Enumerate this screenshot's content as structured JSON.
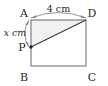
{
  "figure": {
    "type": "geometry-diagram",
    "shape": "rectangle-with-inscribed-triangle",
    "background_color": "#ffffff",
    "stroke_color": "#6e6e6e",
    "diagonal_color": "#3a3a3a",
    "shade_color": "#f2f2f2",
    "text_color": "#2b2b2b",
    "vertices": {
      "A": {
        "label": "A",
        "x": 31,
        "y": 20,
        "position": "top-left"
      },
      "D": {
        "label": "D",
        "x": 86,
        "y": 20,
        "position": "top-right"
      },
      "C": {
        "label": "C",
        "x": 86,
        "y": 66,
        "position": "bottom-right"
      },
      "B": {
        "label": "B",
        "x": 31,
        "y": 66,
        "position": "bottom-left"
      },
      "P": {
        "label": "P",
        "x": 31,
        "y": 47,
        "position": "left-side-point",
        "marked": true
      }
    },
    "segments": [
      {
        "name": "side-AD",
        "from": "A",
        "to": "D"
      },
      {
        "name": "side-DC",
        "from": "D",
        "to": "C"
      },
      {
        "name": "side-CB",
        "from": "C",
        "to": "B"
      },
      {
        "name": "side-BA",
        "from": "B",
        "to": "A"
      },
      {
        "name": "diagonal-PD",
        "from": "P",
        "to": "D"
      }
    ],
    "shaded_region": {
      "name": "triangle-APD",
      "vertices": [
        "A",
        "P",
        "D"
      ]
    },
    "dimensions": [
      {
        "name": "top-dimension-AD",
        "label": "4 cm",
        "value": "4",
        "unit": "cm",
        "italic": false,
        "spans": [
          "A",
          "D"
        ],
        "placement": "above",
        "style": "curved-double-arrow"
      },
      {
        "name": "left-dimension-AP",
        "label": "x cm",
        "value": "x",
        "unit": "cm",
        "italic": true,
        "spans": [
          "A",
          "P"
        ],
        "placement": "left",
        "style": "curved-double-arrow"
      }
    ],
    "vertex_labels": [
      {
        "name": "vertex-label-A",
        "text": "A",
        "x": 21,
        "y": 17
      },
      {
        "name": "vertex-label-D",
        "text": "D",
        "x": 88,
        "y": 17
      },
      {
        "name": "vertex-label-P",
        "text": "P",
        "x": 19,
        "y": 51
      },
      {
        "name": "vertex-label-B",
        "text": "B",
        "x": 21,
        "y": 81
      },
      {
        "name": "vertex-label-C",
        "text": "C",
        "x": 88,
        "y": 81
      }
    ]
  }
}
